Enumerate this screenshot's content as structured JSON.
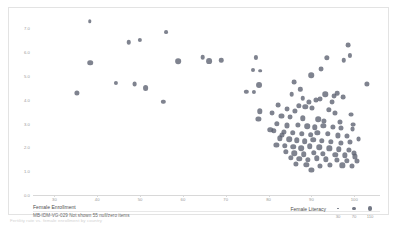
{
  "caption": "Fertility rate vs. female enrollment by country",
  "legend": {
    "title": "Female Literacy",
    "values": [
      "30",
      "70",
      "110"
    ],
    "sizes": [
      1.6,
      3.2,
      4.6
    ]
  },
  "axis_title_x": "Female Enrollment",
  "null_note": "MB-IDM-VG-029 Not shown 55 null/zero items",
  "chart_data": {
    "type": "scatter",
    "title": "",
    "xlabel": "Female Enrollment",
    "ylabel": "",
    "xlim": [
      25,
      106
    ],
    "ylim": [
      0.0,
      7.6
    ],
    "xticks": [
      30,
      40,
      50,
      60,
      70,
      80,
      90,
      100
    ],
    "xticklabels": [
      "30",
      "40",
      "50",
      "60",
      "70",
      "80",
      "90",
      "100"
    ],
    "yticks": [
      0.0,
      1.0,
      2.0,
      3.0,
      4.0,
      5.0,
      6.0,
      7.0
    ],
    "yticklabels": [
      "0.0",
      "1.0",
      "2.0",
      "3.0",
      "4.0",
      "5.0",
      "6.0",
      "7.0"
    ],
    "grid": false,
    "legend_position": "bottom-right",
    "size_field": "Female Literacy",
    "size_legend_values": [
      30,
      70,
      110
    ],
    "point_color": "#5b6070",
    "point_opacity": 0.78,
    "series": [
      {
        "name": "Countries",
        "points": [
          {
            "x": 38.2,
            "y": 7.3,
            "size": 18
          },
          {
            "x": 56.0,
            "y": 6.85,
            "size": 22
          },
          {
            "x": 47.3,
            "y": 6.42,
            "size": 30
          },
          {
            "x": 50.0,
            "y": 6.5,
            "size": 27
          },
          {
            "x": 38.4,
            "y": 5.55,
            "size": 46
          },
          {
            "x": 58.9,
            "y": 5.62,
            "size": 48
          },
          {
            "x": 64.6,
            "y": 5.78,
            "size": 32
          },
          {
            "x": 66.2,
            "y": 5.62,
            "size": 50
          },
          {
            "x": 69.0,
            "y": 5.66,
            "size": 30
          },
          {
            "x": 77.0,
            "y": 5.78,
            "size": 26
          },
          {
            "x": 76.4,
            "y": 5.26,
            "size": 24
          },
          {
            "x": 78.0,
            "y": 5.22,
            "size": 20
          },
          {
            "x": 44.4,
            "y": 4.72,
            "size": 26
          },
          {
            "x": 48.7,
            "y": 4.66,
            "size": 34
          },
          {
            "x": 51.3,
            "y": 4.48,
            "size": 50
          },
          {
            "x": 77.8,
            "y": 4.62,
            "size": 52
          },
          {
            "x": 35.2,
            "y": 4.3,
            "size": 40
          },
          {
            "x": 74.8,
            "y": 4.32,
            "size": 28
          },
          {
            "x": 76.6,
            "y": 4.32,
            "size": 26
          },
          {
            "x": 55.4,
            "y": 3.9,
            "size": 28
          },
          {
            "x": 78.0,
            "y": 3.52,
            "size": 44
          },
          {
            "x": 77.6,
            "y": 3.2,
            "size": 40
          },
          {
            "x": 86.0,
            "y": 4.74,
            "size": 34
          },
          {
            "x": 87.4,
            "y": 4.44,
            "size": 28
          },
          {
            "x": 92.2,
            "y": 5.3,
            "size": 36
          },
          {
            "x": 97.6,
            "y": 5.66,
            "size": 30
          },
          {
            "x": 98.6,
            "y": 6.3,
            "size": 34
          },
          {
            "x": 99.0,
            "y": 5.86,
            "size": 26
          },
          {
            "x": 93.6,
            "y": 5.76,
            "size": 42
          },
          {
            "x": 103.0,
            "y": 4.66,
            "size": 40
          },
          {
            "x": 90.0,
            "y": 5.04,
            "size": 46
          },
          {
            "x": 95.2,
            "y": 4.16,
            "size": 36
          },
          {
            "x": 97.4,
            "y": 4.1,
            "size": 34
          },
          {
            "x": 93.2,
            "y": 4.22,
            "size": 44
          },
          {
            "x": 96.0,
            "y": 4.28,
            "size": 32
          },
          {
            "x": 89.4,
            "y": 3.92,
            "size": 40
          },
          {
            "x": 91.0,
            "y": 3.98,
            "size": 38
          },
          {
            "x": 92.0,
            "y": 4.02,
            "size": 36
          },
          {
            "x": 87.0,
            "y": 3.74,
            "size": 42
          },
          {
            "x": 88.6,
            "y": 3.7,
            "size": 44
          },
          {
            "x": 90.2,
            "y": 3.64,
            "size": 38
          },
          {
            "x": 84.4,
            "y": 3.6,
            "size": 36
          },
          {
            "x": 86.2,
            "y": 3.52,
            "size": 40
          },
          {
            "x": 94.0,
            "y": 3.58,
            "size": 42
          },
          {
            "x": 95.4,
            "y": 3.46,
            "size": 38
          },
          {
            "x": 99.2,
            "y": 3.38,
            "size": 36
          },
          {
            "x": 83.0,
            "y": 3.3,
            "size": 38
          },
          {
            "x": 85.0,
            "y": 3.26,
            "size": 36
          },
          {
            "x": 88.0,
            "y": 3.22,
            "size": 44
          },
          {
            "x": 91.6,
            "y": 3.18,
            "size": 46
          },
          {
            "x": 93.0,
            "y": 3.12,
            "size": 40
          },
          {
            "x": 96.6,
            "y": 3.08,
            "size": 38
          },
          {
            "x": 82.0,
            "y": 2.98,
            "size": 42
          },
          {
            "x": 84.2,
            "y": 2.92,
            "size": 38
          },
          {
            "x": 86.8,
            "y": 2.96,
            "size": 40
          },
          {
            "x": 89.0,
            "y": 2.88,
            "size": 46
          },
          {
            "x": 90.8,
            "y": 2.84,
            "size": 44
          },
          {
            "x": 92.8,
            "y": 2.9,
            "size": 42
          },
          {
            "x": 95.0,
            "y": 2.86,
            "size": 40
          },
          {
            "x": 97.0,
            "y": 2.8,
            "size": 38
          },
          {
            "x": 99.6,
            "y": 2.76,
            "size": 36
          },
          {
            "x": 81.2,
            "y": 2.7,
            "size": 44
          },
          {
            "x": 83.6,
            "y": 2.66,
            "size": 40
          },
          {
            "x": 85.6,
            "y": 2.62,
            "size": 46
          },
          {
            "x": 87.8,
            "y": 2.58,
            "size": 44
          },
          {
            "x": 89.8,
            "y": 2.54,
            "size": 48
          },
          {
            "x": 91.4,
            "y": 2.6,
            "size": 42
          },
          {
            "x": 93.8,
            "y": 2.56,
            "size": 44
          },
          {
            "x": 96.2,
            "y": 2.5,
            "size": 40
          },
          {
            "x": 98.4,
            "y": 2.46,
            "size": 38
          },
          {
            "x": 82.6,
            "y": 2.38,
            "size": 42
          },
          {
            "x": 84.8,
            "y": 2.34,
            "size": 46
          },
          {
            "x": 86.6,
            "y": 2.3,
            "size": 44
          },
          {
            "x": 88.4,
            "y": 2.26,
            "size": 48
          },
          {
            "x": 90.4,
            "y": 2.32,
            "size": 46
          },
          {
            "x": 92.4,
            "y": 2.28,
            "size": 44
          },
          {
            "x": 94.6,
            "y": 2.22,
            "size": 42
          },
          {
            "x": 96.8,
            "y": 2.18,
            "size": 40
          },
          {
            "x": 99.0,
            "y": 2.24,
            "size": 38
          },
          {
            "x": 81.8,
            "y": 2.1,
            "size": 40
          },
          {
            "x": 83.8,
            "y": 2.06,
            "size": 44
          },
          {
            "x": 85.8,
            "y": 2.02,
            "size": 46
          },
          {
            "x": 87.6,
            "y": 1.98,
            "size": 48
          },
          {
            "x": 89.6,
            "y": 2.04,
            "size": 46
          },
          {
            "x": 91.8,
            "y": 2.0,
            "size": 44
          },
          {
            "x": 94.2,
            "y": 1.96,
            "size": 42
          },
          {
            "x": 96.4,
            "y": 1.92,
            "size": 44
          },
          {
            "x": 98.8,
            "y": 1.88,
            "size": 40
          },
          {
            "x": 84.0,
            "y": 1.8,
            "size": 42
          },
          {
            "x": 86.0,
            "y": 1.76,
            "size": 44
          },
          {
            "x": 88.2,
            "y": 1.72,
            "size": 46
          },
          {
            "x": 90.6,
            "y": 1.78,
            "size": 44
          },
          {
            "x": 92.6,
            "y": 1.74,
            "size": 42
          },
          {
            "x": 95.6,
            "y": 1.7,
            "size": 44
          },
          {
            "x": 97.8,
            "y": 1.66,
            "size": 42
          },
          {
            "x": 100.2,
            "y": 1.62,
            "size": 40
          },
          {
            "x": 85.2,
            "y": 1.56,
            "size": 42
          },
          {
            "x": 87.2,
            "y": 1.52,
            "size": 44
          },
          {
            "x": 89.2,
            "y": 1.48,
            "size": 42
          },
          {
            "x": 91.2,
            "y": 1.54,
            "size": 44
          },
          {
            "x": 93.4,
            "y": 1.5,
            "size": 42
          },
          {
            "x": 96.0,
            "y": 1.46,
            "size": 40
          },
          {
            "x": 98.2,
            "y": 1.42,
            "size": 42
          },
          {
            "x": 100.6,
            "y": 1.44,
            "size": 38
          },
          {
            "x": 86.4,
            "y": 1.3,
            "size": 40
          },
          {
            "x": 88.8,
            "y": 1.26,
            "size": 42
          },
          {
            "x": 92.0,
            "y": 1.22,
            "size": 38
          },
          {
            "x": 94.4,
            "y": 1.28,
            "size": 40
          },
          {
            "x": 97.2,
            "y": 1.24,
            "size": 42
          },
          {
            "x": 99.4,
            "y": 1.2,
            "size": 38
          },
          {
            "x": 90.0,
            "y": 1.04,
            "size": 40
          },
          {
            "x": 80.4,
            "y": 2.74,
            "size": 44
          },
          {
            "x": 80.8,
            "y": 3.44,
            "size": 36
          },
          {
            "x": 82.2,
            "y": 3.76,
            "size": 34
          },
          {
            "x": 83.2,
            "y": 2.52,
            "size": 38
          },
          {
            "x": 94.8,
            "y": 3.9,
            "size": 36
          },
          {
            "x": 85.4,
            "y": 4.22,
            "size": 32
          },
          {
            "x": 99.8,
            "y": 2.96,
            "size": 34
          },
          {
            "x": 101.0,
            "y": 2.34,
            "size": 36
          },
          {
            "x": 100.0,
            "y": 1.76,
            "size": 38
          },
          {
            "x": 88.0,
            "y": 4.06,
            "size": 30
          }
        ]
      }
    ]
  }
}
